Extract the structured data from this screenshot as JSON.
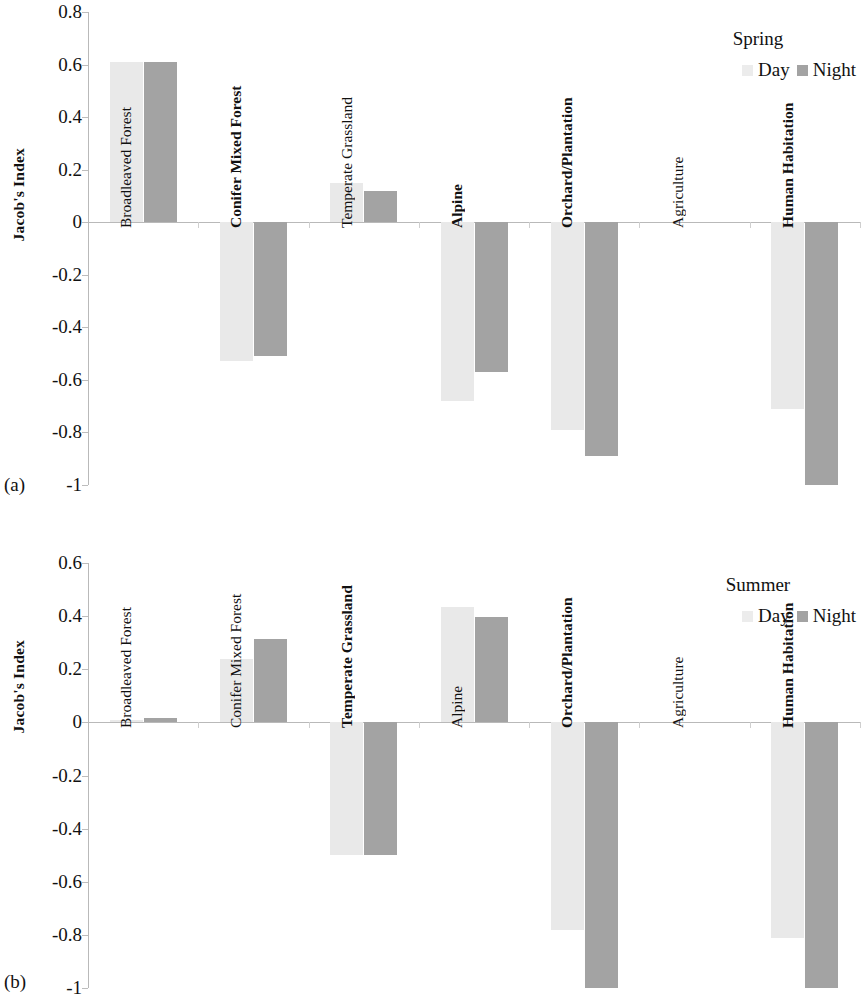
{
  "figure": {
    "panels": [
      {
        "tag": "(a)",
        "axis_title": "Jacob's Index",
        "legend_title": "Spring",
        "legend": [
          {
            "label": "Day"
          },
          {
            "label": "Night"
          }
        ],
        "yticks": [
          "0.8",
          "0.6",
          "0.4",
          "0.2",
          "0",
          "-0.2",
          "-0.4",
          "-0.6",
          "-0.8",
          "-1"
        ]
      },
      {
        "tag": "(b)",
        "axis_title": "Jacob's Index",
        "legend_title": "Summer",
        "legend": [
          {
            "label": "Day"
          },
          {
            "label": "Night"
          }
        ],
        "yticks": [
          "0.6",
          "0.4",
          "0.2",
          "0",
          "-0.2",
          "-0.4",
          "-0.6",
          "-0.8",
          "-1"
        ]
      }
    ]
  },
  "colors": {
    "day": "#ececec",
    "night": "#a3a3a3",
    "axis": "#b9b9b9",
    "text": "#111111"
  },
  "chart_data": [
    {
      "type": "bar",
      "title": "Spring",
      "panel": "(a)",
      "xlabel": "",
      "ylabel": "Jacob's Index",
      "ylim": [
        -1,
        0.8
      ],
      "ytick_step": 0.2,
      "grid": false,
      "legend_position": "top-right",
      "categories": [
        "Broadleaved Forest",
        "Conifer Mixed Forest",
        "Temperate Grassland",
        "Alpine",
        "Orchard/Plantation",
        "Agriculture",
        "Human Habitation"
      ],
      "series": [
        {
          "name": "Day",
          "values": [
            0.61,
            -0.53,
            0.15,
            -0.68,
            -0.79,
            0.0,
            -0.71
          ]
        },
        {
          "name": "Night",
          "values": [
            0.61,
            -0.51,
            0.12,
            -0.57,
            -0.89,
            0.0,
            -1.0
          ]
        }
      ]
    },
    {
      "type": "bar",
      "title": "Summer",
      "panel": "(b)",
      "xlabel": "",
      "ylabel": "Jacob's Index",
      "ylim": [
        -1,
        0.6
      ],
      "ytick_step": 0.2,
      "grid": false,
      "legend_position": "top-right",
      "categories": [
        "Broadleaved Forest",
        "Conifer Mixed Forest",
        "Temperate Grassland",
        "Alpine",
        "Orchard/Plantation",
        "Agriculture",
        "Human Habitation"
      ],
      "series": [
        {
          "name": "Day",
          "values": [
            0.01,
            0.24,
            -0.5,
            0.435,
            -0.78,
            0.0,
            -0.81
          ]
        },
        {
          "name": "Night",
          "values": [
            0.015,
            0.315,
            -0.5,
            0.395,
            -1.0,
            0.0,
            -1.0
          ]
        }
      ]
    }
  ]
}
